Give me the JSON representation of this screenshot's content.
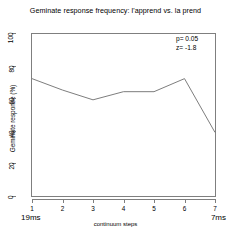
{
  "chart_data": {
    "type": "line",
    "title": "Geminate response frequency: l'apprend vs. la prend",
    "xlabel": "continuum steps",
    "ylabel": "Geminate response (%)",
    "x": [
      1,
      2,
      3,
      4,
      5,
      6,
      7
    ],
    "categories": [
      "1",
      "2",
      "3",
      "4",
      "5",
      "6",
      "7"
    ],
    "values": [
      72,
      65,
      59,
      64,
      64,
      72,
      39
    ],
    "series": [
      {
        "name": "geminate response",
        "values": [
          72,
          65,
          59,
          64,
          64,
          72,
          39
        ]
      }
    ],
    "xlim": [
      1,
      7
    ],
    "ylim": [
      0,
      100
    ],
    "ytick_labels": [
      "100",
      "80",
      "60",
      "40",
      "20",
      "0"
    ],
    "ytick_values": [
      100,
      80,
      60,
      40,
      20,
      0
    ],
    "xtick_labels": [
      "1",
      "2",
      "3",
      "4",
      "5",
      "6",
      "7"
    ],
    "grid": false,
    "legend": null,
    "line_color": "#6e6e6e",
    "annotations": {
      "stats_p": "p= 0.05",
      "stats_z": "z= -1.8",
      "endpoint_left": "19ms",
      "endpoint_right": "7ms"
    }
  },
  "axis": {
    "y_ticks": [
      {
        "label": "100",
        "value": 100
      },
      {
        "label": "80",
        "value": 80
      },
      {
        "label": "60",
        "value": 60
      },
      {
        "label": "40",
        "value": 40
      },
      {
        "label": "20",
        "value": 20
      },
      {
        "label": "0",
        "value": 0
      }
    ],
    "x_ticks": [
      {
        "label": "1",
        "value": 1
      },
      {
        "label": "2",
        "value": 2
      },
      {
        "label": "3",
        "value": 3
      },
      {
        "label": "4",
        "value": 4
      },
      {
        "label": "5",
        "value": 5
      },
      {
        "label": "6",
        "value": 6
      },
      {
        "label": "7",
        "value": 7
      }
    ]
  }
}
